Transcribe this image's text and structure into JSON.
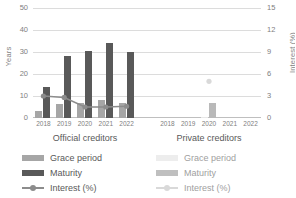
{
  "chart_data": {
    "type": "bar",
    "title": "",
    "xlabel": "",
    "ylabel": "Years",
    "y2label": "Interest (%)",
    "ylim": [
      0,
      50
    ],
    "y2lim": [
      0,
      15
    ],
    "yticks": [
      "0",
      "10",
      "20",
      "30",
      "40",
      "50"
    ],
    "y2ticks": [
      "0",
      "3",
      "6",
      "9",
      "12",
      "15"
    ],
    "grid": true,
    "legend_position": "bottom",
    "groups": [
      {
        "name": "Official creditors",
        "categories": [
          "2018",
          "2019",
          "2020",
          "2021",
          "2022"
        ],
        "series": [
          {
            "name": "Grace period",
            "axis": "left",
            "type": "bar",
            "values": [
              3,
              6.5,
              7,
              8,
              7
            ]
          },
          {
            "name": "Maturity",
            "axis": "left",
            "type": "bar",
            "values": [
              14,
              28,
              30.5,
              34,
              30
            ]
          },
          {
            "name": "Interest (%)",
            "axis": "right",
            "type": "line",
            "values": [
              3.0,
              2.8,
              1.5,
              1.5,
              1.6
            ]
          }
        ]
      },
      {
        "name": "Private creditors",
        "categories": [
          "2018",
          "2019",
          "2020",
          "2021",
          "2022"
        ],
        "series": [
          {
            "name": "Grace period",
            "axis": "left",
            "type": "bar",
            "values": [
              null,
              null,
              0.4,
              null,
              null
            ]
          },
          {
            "name": "Maturity",
            "axis": "left",
            "type": "bar",
            "values": [
              null,
              null,
              7,
              null,
              null
            ]
          },
          {
            "name": "Interest (%)",
            "axis": "right",
            "type": "line",
            "values": [
              null,
              null,
              5.0,
              null,
              null
            ]
          }
        ]
      }
    ]
  },
  "axes": {
    "left_title": "Years",
    "right_title": "Interest (%)",
    "left_ticks": [
      "50",
      "40",
      "30",
      "20",
      "10",
      "0"
    ],
    "right_ticks": [
      "15",
      "12",
      "9",
      "6",
      "3",
      "0"
    ]
  },
  "groups": {
    "official": {
      "name": "Official creditors",
      "categories": [
        "2018",
        "2019",
        "2020",
        "2021",
        "2022"
      ]
    },
    "private": {
      "name": "Private creditors",
      "categories": [
        "2018",
        "2019",
        "2020",
        "2021",
        "2022"
      ]
    }
  },
  "legend_official": {
    "grace": "Grace period",
    "maturity": "Maturity",
    "interest": "Interest (%)"
  },
  "legend_private": {
    "grace": "Grace period",
    "maturity": "Maturity",
    "interest": "Interest (%)"
  },
  "colors": {
    "official_grace": "#a6a6a6",
    "official_maturity": "#595959",
    "official_interest": "#8c8c8c",
    "private_grace": "#e8e8e8",
    "private_maturity": "#b9b9b9",
    "private_interest": "#d9d9d9",
    "grid": "#dcdcdc",
    "text": "#595959"
  }
}
